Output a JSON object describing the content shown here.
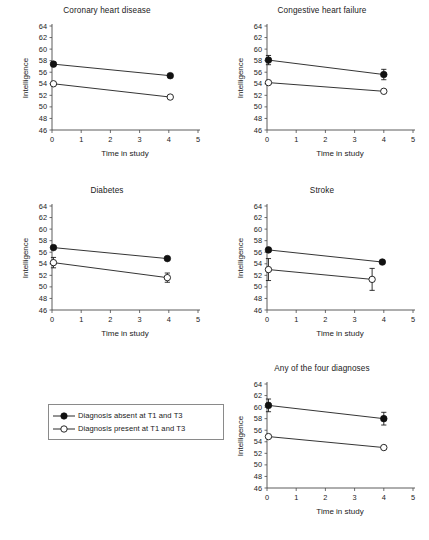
{
  "figure": {
    "axis": {
      "xlabel": "Time in study",
      "ylabel": "Intelligence",
      "xlim": [
        0,
        5
      ],
      "ylim": [
        46,
        64
      ],
      "xticks": [
        "0",
        "1",
        "2",
        "3",
        "4",
        "5"
      ],
      "yticks": [
        "46",
        "48",
        "50",
        "52",
        "54",
        "56",
        "58",
        "60",
        "62",
        "64"
      ],
      "grid": false
    },
    "legend": {
      "position": "bottom-left",
      "entries": [
        {
          "marker": "filled-circle",
          "label": "Diagnosis absent at T1 and T3"
        },
        {
          "marker": "open-circle",
          "label": "Diagnosis present at T1 and T3"
        }
      ]
    }
  },
  "chart_data": [
    {
      "type": "line",
      "title": "Coronary heart disease",
      "xlabel": "Time in study",
      "ylabel": "Intelligence",
      "xlim": [
        0,
        5
      ],
      "ylim": [
        46,
        64
      ],
      "x": [
        0.05,
        4.05
      ],
      "series": [
        {
          "name": "Diagnosis absent at T1 and T3",
          "marker": "filled-circle",
          "values": [
            57.4,
            55.4
          ],
          "errors": [
            0,
            0
          ]
        },
        {
          "name": "Diagnosis present at T1 and T3",
          "marker": "open-circle",
          "values": [
            54.0,
            51.7
          ],
          "errors": [
            0,
            0
          ]
        }
      ]
    },
    {
      "type": "line",
      "title": "Congestive heart failure",
      "xlabel": "Time in study",
      "ylabel": "Intelligence",
      "xlim": [
        0,
        5
      ],
      "ylim": [
        46,
        64
      ],
      "x": [
        0.05,
        4.0
      ],
      "series": [
        {
          "name": "Diagnosis absent at T1 and T3",
          "marker": "filled-circle",
          "values": [
            58.1,
            55.6
          ],
          "errors": [
            0.8,
            0.9
          ]
        },
        {
          "name": "Diagnosis present at T1 and T3",
          "marker": "open-circle",
          "values": [
            54.2,
            52.7
          ],
          "errors": [
            0,
            0
          ]
        }
      ]
    },
    {
      "type": "line",
      "title": "Diabetes",
      "xlabel": "Time in study",
      "ylabel": "Intelligence",
      "xlim": [
        0,
        5
      ],
      "ylim": [
        46,
        64
      ],
      "x": [
        0.05,
        3.95
      ],
      "series": [
        {
          "name": "Diagnosis absent at T1 and T3",
          "marker": "filled-circle",
          "values": [
            56.8,
            54.9
          ],
          "errors": [
            0,
            0
          ]
        },
        {
          "name": "Diagnosis present at T1 and T3",
          "marker": "open-circle",
          "values": [
            54.2,
            51.6
          ],
          "errors": [
            0.9,
            0.8
          ]
        }
      ]
    },
    {
      "type": "line",
      "title": "Stroke",
      "xlabel": "Time in study",
      "ylabel": "Intelligence",
      "xlim": [
        0,
        5
      ],
      "ylim": [
        46,
        64
      ],
      "x": [
        0.05,
        3.6
      ],
      "series": [
        {
          "name": "Diagnosis absent at T1 and T3",
          "marker": "filled-circle",
          "values": [
            56.4,
            54.3
          ],
          "errors": [
            0,
            0
          ],
          "x": [
            0.05,
            3.95
          ]
        },
        {
          "name": "Diagnosis present at T1 and T3",
          "marker": "open-circle",
          "values": [
            53.0,
            51.3
          ],
          "errors": [
            1.9,
            1.9
          ]
        }
      ]
    },
    {
      "type": "line",
      "title": "Any of the four diagnoses",
      "xlabel": "Time in study",
      "ylabel": "Intelligence",
      "xlim": [
        0,
        5
      ],
      "ylim": [
        46,
        64
      ],
      "x": [
        0.05,
        4.0
      ],
      "series": [
        {
          "name": "Diagnosis absent at T1 and T3",
          "marker": "filled-circle",
          "values": [
            60.3,
            58.0
          ],
          "errors": [
            1.1,
            1.1
          ]
        },
        {
          "name": "Diagnosis present at T1 and T3",
          "marker": "open-circle",
          "values": [
            54.9,
            53.0
          ],
          "errors": [
            0,
            0
          ]
        }
      ]
    }
  ]
}
